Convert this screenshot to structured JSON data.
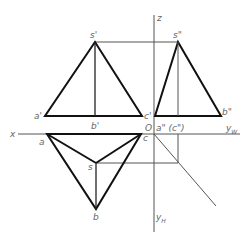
{
  "diagram": {
    "axes": {
      "x_label": "x",
      "z_label": "z",
      "origin_label": "O",
      "yw_label": "y",
      "yw_sub": "W",
      "yh_label": "y",
      "yh_sub": "H"
    },
    "front_view": {
      "s": "s'",
      "a": "a'",
      "b": "b'",
      "c": "c'"
    },
    "side_view": {
      "s": "s\"",
      "ac": "a\" (c\")",
      "b": "b\""
    },
    "top_view": {
      "a": "a",
      "b": "b",
      "c": "c",
      "s": "s"
    },
    "colors": {
      "object_lines": "#111111",
      "construction_lines": "#555555",
      "labels": "#666666"
    }
  }
}
